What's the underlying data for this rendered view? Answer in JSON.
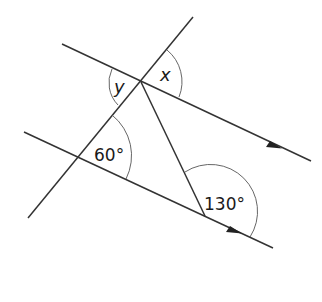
{
  "diagram": {
    "type": "parallel-lines-angles",
    "labels": {
      "x": "x",
      "y": "y",
      "angle_60": "60°",
      "angle_130": "130°"
    },
    "angles": [
      {
        "name": "x",
        "value": "unknown",
        "location": "upper intersection, above upper line, right of transversal"
      },
      {
        "name": "y",
        "value": "unknown",
        "location": "upper intersection, below upper line, left of transversal"
      },
      {
        "name": "60°",
        "value": 60,
        "location": "lower intersection, between transversal and lower line"
      },
      {
        "name": "130°",
        "value": 130,
        "location": "lower-right vertex, between segment and lower line extension"
      }
    ],
    "parallel_marks": [
      "arrow on upper line",
      "arrow on lower line"
    ],
    "colors": {
      "stroke": "#333333",
      "background": "#ffffff"
    }
  }
}
